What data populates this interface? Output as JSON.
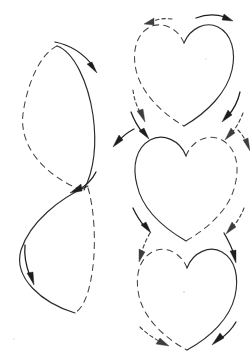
{
  "figure": {
    "background_color": "#ffffff",
    "width": 250,
    "height": 354,
    "stroke_color_solid": "#2b2b2b",
    "stroke_color_dashed": "#454545",
    "arrow_color": "#1d1d1d",
    "panels": [
      {
        "id": "left-column",
        "label": "figure-eight path",
        "shape": "lemniscate",
        "loops": 2,
        "loop_upper": {
          "label": "upper loop",
          "solid_side": "right",
          "dashed_side": "left",
          "bounds": {
            "x": 22,
            "y": 45,
            "width": 73,
            "height": 145
          }
        },
        "loop_lower": {
          "label": "lower loop",
          "solid_side": "left",
          "dashed_side": "right",
          "bounds": {
            "x": 18,
            "y": 190,
            "width": 77,
            "height": 125
          }
        },
        "crossing_point": {
          "x": 84,
          "y": 190
        },
        "arrows": [
          {
            "id": "top-arc-arrow",
            "style": "solid",
            "direction": "right-down",
            "at": {
              "x": 60,
              "y": 46
            }
          },
          {
            "id": "crossing-arrow",
            "style": "solid",
            "direction": "down-left",
            "at": {
              "x": 82,
              "y": 188
            }
          },
          {
            "id": "bottom-left-arrow",
            "style": "solid",
            "direction": "down-left",
            "at": {
              "x": 30,
              "y": 260
            }
          }
        ]
      },
      {
        "id": "heart-1",
        "label": "top heart",
        "shape": "cardioid",
        "solid_side": "right",
        "dashed_side": "left",
        "bounds": {
          "x": 133,
          "y": 22,
          "width": 102,
          "height": 103
        },
        "arrows": [
          {
            "id": "heart1-top-left-arrow",
            "style": "dashed",
            "direction": "left",
            "at": {
              "x": 148,
              "y": 23
            }
          },
          {
            "id": "heart1-top-right-arrow",
            "style": "solid",
            "direction": "right",
            "at": {
              "x": 200,
              "y": 19
            }
          },
          {
            "id": "heart1-bottom-left-arrow",
            "style": "dashed",
            "direction": "down-left",
            "at": {
              "x": 140,
              "y": 110
            }
          },
          {
            "id": "heart1-bottom-right-arrow",
            "style": "solid",
            "direction": "down-left",
            "at": {
              "x": 228,
              "y": 112
            }
          }
        ]
      },
      {
        "id": "heart-2",
        "label": "middle heart",
        "shape": "cardioid",
        "solid_side": "left",
        "dashed_side": "right",
        "bounds": {
          "x": 133,
          "y": 133,
          "width": 107,
          "height": 107
        },
        "arrows": [
          {
            "id": "heart2-top-left-arrow",
            "style": "solid",
            "direction": "down-right",
            "at": {
              "x": 140,
              "y": 128
            }
          },
          {
            "id": "heart2-top-right-arrow",
            "style": "dashed",
            "direction": "down-right",
            "at": {
              "x": 232,
              "y": 128
            }
          },
          {
            "id": "heart2-upper-left-out-arrow",
            "style": "solid",
            "direction": "left",
            "at": {
              "x": 138,
              "y": 135
            }
          },
          {
            "id": "heart2-upper-right-out-arrow",
            "style": "dashed",
            "direction": "down-right",
            "at": {
              "x": 236,
              "y": 136
            }
          },
          {
            "id": "heart2-bottom-left-arrow",
            "style": "solid",
            "direction": "down-right",
            "at": {
              "x": 142,
              "y": 224
            }
          },
          {
            "id": "heart2-bottom-right-arrow",
            "style": "dashed",
            "direction": "down-left",
            "at": {
              "x": 233,
              "y": 224
            }
          }
        ]
      },
      {
        "id": "heart-3",
        "label": "bottom heart",
        "shape": "cardioid",
        "solid_side": "right",
        "dashed_side": "left",
        "bounds": {
          "x": 137,
          "y": 245,
          "width": 100,
          "height": 105
        },
        "arrows": [
          {
            "id": "heart3-top-left-arrow",
            "style": "dashed",
            "direction": "down-left",
            "at": {
              "x": 142,
              "y": 240
            }
          },
          {
            "id": "heart3-top-right-arrow",
            "style": "solid",
            "direction": "down-right",
            "at": {
              "x": 230,
              "y": 240
            }
          },
          {
            "id": "heart3-bottom-left-arrow",
            "style": "dashed",
            "direction": "down-right",
            "at": {
              "x": 160,
              "y": 338
            }
          },
          {
            "id": "heart3-bottom-right-arrow",
            "style": "solid",
            "direction": "down-left",
            "at": {
              "x": 222,
              "y": 336
            }
          }
        ]
      }
    ]
  }
}
